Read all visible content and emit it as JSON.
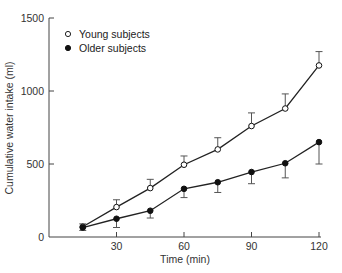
{
  "chart_data": {
    "type": "line",
    "title": "",
    "xlabel": "Time (min)",
    "ylabel": "Cumulative water intake (ml)",
    "x": [
      15,
      30,
      45,
      60,
      75,
      90,
      105,
      120
    ],
    "xticks": [
      30,
      60,
      90,
      120
    ],
    "yticks": [
      0,
      500,
      1000,
      1500
    ],
    "xlim": [
      0,
      120
    ],
    "ylim": [
      0,
      1500
    ],
    "grid": false,
    "legend_position": "upper-left",
    "series": [
      {
        "name": "Young subjects",
        "marker": "open-circle",
        "values": [
          70,
          205,
          335,
          495,
          600,
          760,
          880,
          1175
        ],
        "error": [
          20,
          50,
          60,
          60,
          80,
          90,
          100,
          95
        ]
      },
      {
        "name": "Older subjects",
        "marker": "filled-circle",
        "values": [
          65,
          125,
          180,
          330,
          375,
          445,
          505,
          650
        ],
        "error": [
          20,
          60,
          50,
          60,
          70,
          80,
          100,
          150
        ]
      }
    ]
  },
  "layout": {
    "origin_px": [
      49,
      237
    ],
    "x_px_per_unit": 2.25,
    "y_px_per_unit": 0.146,
    "y_top_px": 18,
    "x_right_px": 321
  },
  "colors": {
    "line": "#222222",
    "axis": "#444444",
    "open_fill": "#ffffff"
  }
}
